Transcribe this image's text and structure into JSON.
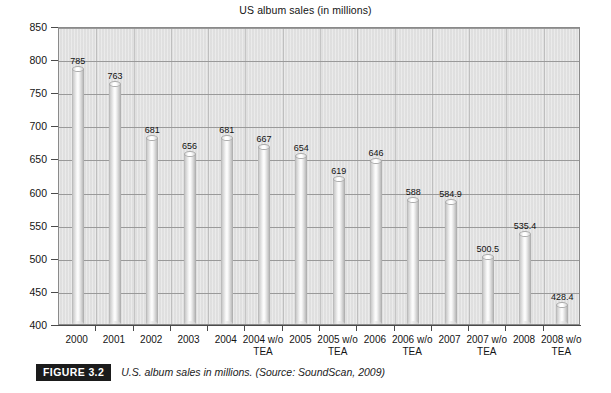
{
  "chart_data": {
    "type": "bar",
    "title": "US album sales (in millions)",
    "xlabel": "",
    "ylabel": "",
    "ylim": [
      400,
      850
    ],
    "ytick_step": 50,
    "yticks": [
      400,
      450,
      500,
      550,
      600,
      650,
      700,
      750,
      800,
      850
    ],
    "grid": "horizontal",
    "legend": "none",
    "categories": [
      "2000",
      "2001",
      "2002",
      "2003",
      "2004",
      "2004 w/o TEA",
      "2005",
      "2005 w/o TEA",
      "2006",
      "2006 w/o TEA",
      "2007",
      "2007 w/o TEA",
      "2008",
      "2008 w/o TEA"
    ],
    "category_lines": [
      [
        "2000",
        ""
      ],
      [
        "2001",
        ""
      ],
      [
        "2002",
        ""
      ],
      [
        "2003",
        ""
      ],
      [
        "2004",
        ""
      ],
      [
        "2004 w/o",
        "TEA"
      ],
      [
        "2005",
        ""
      ],
      [
        "2005 w/o",
        "TEA"
      ],
      [
        "2006",
        ""
      ],
      [
        "2006 w/o",
        "TEA"
      ],
      [
        "2007",
        ""
      ],
      [
        "2007 w/o",
        "TEA"
      ],
      [
        "2008",
        ""
      ],
      [
        "2008 w/o",
        "TEA"
      ]
    ],
    "values": [
      785,
      763,
      681,
      656,
      681,
      667,
      654,
      619,
      646,
      588,
      584.9,
      500.5,
      535.4,
      428.4
    ],
    "value_labels": [
      "785",
      "763",
      "681",
      "656",
      "681",
      "667",
      "654",
      "619",
      "646",
      "588",
      "584.9",
      "500.5",
      "535.4",
      "428.4"
    ]
  },
  "caption": {
    "badge": "FIGURE 3.2",
    "text": "U.S. album sales in millions. (Source: SoundScan, 2009)"
  },
  "colors": {
    "plot_background": "#e2e2e2",
    "gridline": "#9a9a9a",
    "axis": "#4a4a4a",
    "bar_light": "#ffffff",
    "bar_dark": "#a8a8a8",
    "text": "#141414",
    "badge_background": "#1b1b1b",
    "badge_text": "#ffffff",
    "page_background": "#ffffff"
  }
}
